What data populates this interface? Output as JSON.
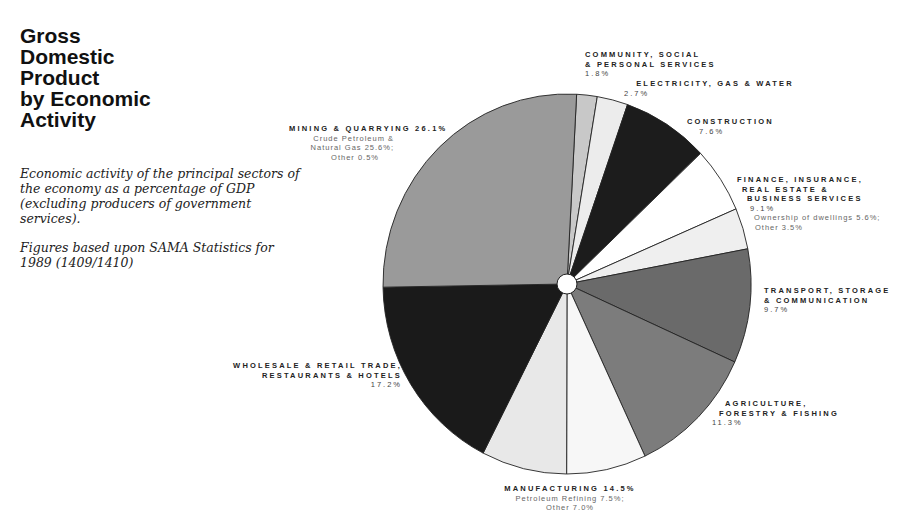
{
  "title": [
    "Gross",
    "Domestic",
    "Product",
    "by Economic",
    "Activity"
  ],
  "description": [
    "Economic activity of the principal sectors of the economy as a percentage of GDP (excluding producers of government services).",
    "Figures based upon SAMA Statistics for 1989 (1409/1410)"
  ],
  "labels": {
    "community": {
      "line1": "COMMUNITY, SOCIAL",
      "line2": "& PERSONAL SERVICES",
      "pct": "1.8%"
    },
    "electricity": {
      "line1": "ELECTRICITY, GAS & WATER",
      "pct": "2.7%"
    },
    "construction": {
      "line1": "CONSTRUCTION",
      "pct": "7.6%"
    },
    "finance": {
      "line1": "FINANCE, INSURANCE,",
      "line2": "REAL ESTATE &",
      "line3": "BUSINESS SERVICES",
      "pct": "9.1%",
      "sub1": "Ownership of dwellings 5.6%;",
      "sub2": "Other 3.5%"
    },
    "transport": {
      "line1": "TRANSPORT, STORAGE",
      "line2": "& COMMUNICATION",
      "pct": "9.7%"
    },
    "agriculture": {
      "line1": "AGRICULTURE,",
      "line2": "FORESTRY & FISHING",
      "pct": "11.3%"
    },
    "manufacturing": {
      "line1": "MANUFACTURING 14.5%",
      "sub1": "Petroleum Refining 7.5%;",
      "sub2": "Other 7.0%"
    },
    "wholesale": {
      "line1": "WHOLESALE & RETAIL TRADE,",
      "line2": "RESTAURANTS & HOTELS",
      "pct": "17.2%"
    },
    "mining": {
      "line1": "MINING & QUARRYING 26.1%",
      "sub1": "Crude Petroleum &",
      "sub2": "Natural Gas 25.6%;",
      "sub3": "Other 0.5%"
    }
  },
  "chart_data": {
    "type": "pie",
    "title": "Gross Domestic Product by Economic Activity",
    "subtitle": "Economic activity of the principal sectors of the economy as a percentage of GDP (excluding producers of government services). Figures based upon SAMA Statistics for 1989 (1409/1410)",
    "unit": "%",
    "start_angle": "12 o'clock, clockwise",
    "categories": [
      "Community, Social & Personal Services",
      "Electricity, Gas & Water",
      "Construction",
      "Finance, Insurance, Real Estate & Business Services",
      "Transport, Storage & Communication",
      "Agriculture, Forestry & Fishing",
      "Manufacturing",
      "Wholesale & Retail Trade, Restaurants & Hotels",
      "Mining & Quarrying"
    ],
    "values": [
      1.8,
      2.7,
      7.6,
      9.1,
      9.7,
      11.3,
      14.5,
      17.2,
      26.1
    ],
    "sub_slices": [
      {
        "parent": "Finance, Insurance, Real Estate & Business Services",
        "name": "Ownership of dwellings",
        "value": 5.6
      },
      {
        "parent": "Finance, Insurance, Real Estate & Business Services",
        "name": "Other",
        "value": 3.5
      },
      {
        "parent": "Manufacturing",
        "name": "Other",
        "value": 7.0
      },
      {
        "parent": "Manufacturing",
        "name": "Petroleum Refining",
        "value": 7.5
      },
      {
        "parent": "Mining & Quarrying",
        "name": "Crude Petroleum & Natural Gas",
        "value": 25.6
      },
      {
        "parent": "Mining & Quarrying",
        "name": "Other",
        "value": 0.5
      }
    ],
    "slices_drawn": [
      {
        "name": "Community",
        "value": 1.8,
        "color": "#c8c8c8"
      },
      {
        "name": "Electricity",
        "value": 2.7,
        "color": "#ececec"
      },
      {
        "name": "Construction",
        "value": 7.6,
        "color": "#1c1c1c"
      },
      {
        "name": "Finance: Ownership of dwellings",
        "value": 5.6,
        "color": "#ffffff"
      },
      {
        "name": "Finance: Other",
        "value": 3.5,
        "color": "#efefef"
      },
      {
        "name": "Transport",
        "value": 9.7,
        "color": "#6a6a6a"
      },
      {
        "name": "Agriculture",
        "value": 11.3,
        "color": "#7c7c7c"
      },
      {
        "name": "Manufacturing: Other",
        "value": 7.0,
        "color": "#f7f7f7"
      },
      {
        "name": "Manufacturing: Petroleum Refining",
        "value": 7.5,
        "color": "#e8e8e8"
      },
      {
        "name": "Wholesale",
        "value": 17.2,
        "color": "#1a1a1a"
      },
      {
        "name": "Mining",
        "value": 26.1,
        "color": "#9a9a9a"
      }
    ],
    "legend": "none (direct labels)"
  }
}
